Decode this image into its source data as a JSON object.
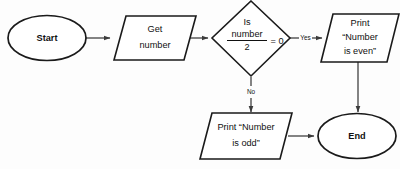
{
  "diagram": {
    "type": "flowchart",
    "background_color": "#fdfdfd",
    "line_color": "#1a1a1a",
    "connector_color": "#3b3b3b",
    "text_color": "#111111"
  },
  "nodes": {
    "start": {
      "shape": "ellipse",
      "label": "Start"
    },
    "get_number": {
      "shape": "parallelogram",
      "line1": "Get",
      "line2": "number"
    },
    "decision": {
      "shape": "diamond",
      "line1": "Is",
      "numerator": "number",
      "denominator": "2",
      "comparison": "= 0"
    },
    "print_even": {
      "shape": "parallelogram",
      "line1": "Print",
      "line2": "“Number",
      "line3": "is even”"
    },
    "print_odd": {
      "shape": "parallelogram",
      "line1": "Print “Number",
      "line2": "is odd”"
    },
    "end": {
      "shape": "ellipse",
      "label": "End"
    }
  },
  "edges": {
    "start_to_get": {
      "label": ""
    },
    "get_to_decision": {
      "label": ""
    },
    "decision_yes": {
      "label": "Yes"
    },
    "decision_no": {
      "label": "No"
    },
    "even_to_end": {
      "label": ""
    },
    "odd_to_end": {
      "label": ""
    }
  }
}
